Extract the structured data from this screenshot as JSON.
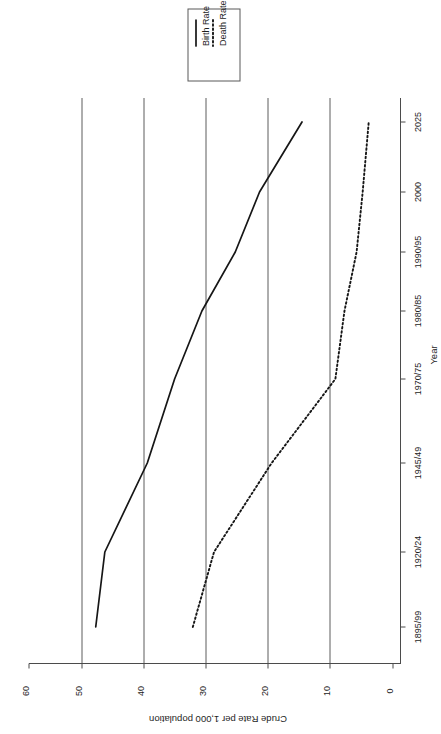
{
  "chart_data": {
    "type": "line",
    "title": "",
    "xlabel": "Year",
    "ylabel": "Crude Rate per 1,000 population",
    "orientation": "rotated-90-ccw",
    "grid": true,
    "legend_position": "top-left",
    "ylim": [
      0,
      60
    ],
    "yticks": [
      0,
      10,
      20,
      30,
      40,
      50,
      60
    ],
    "ytick_labels": [
      "0",
      "10",
      "20",
      "30",
      "40",
      "50",
      "60"
    ],
    "gridlines_at": [
      10,
      20,
      30,
      40,
      50
    ],
    "categories": [
      "1895/99",
      "1920/24",
      "1945/49",
      "1970/75",
      "1980/85",
      "1990/95",
      "2000",
      "2025"
    ],
    "x": [
      "1895/99",
      "1920/24",
      "1945/49",
      "1970/75",
      "1980/85",
      "1990/95",
      "2000",
      "2025"
    ],
    "series": [
      {
        "name": "Birth Rate",
        "style": "solid",
        "color": "#161616",
        "values": [
          49.0,
          47.5,
          40.5,
          36.0,
          31.5,
          26.0,
          22.0,
          15.0
        ]
      },
      {
        "name": "Death Rate",
        "style": "dotted",
        "color": "#161616",
        "values": [
          33.0,
          29.5,
          20.0,
          9.5,
          8.0,
          6.0,
          5.0,
          4.0
        ]
      }
    ]
  },
  "legend": {
    "items": [
      {
        "label": "Birth Rate",
        "style": "solid"
      },
      {
        "label": "Death Rate",
        "style": "dotted"
      }
    ]
  },
  "axes": {
    "x_title": "Year",
    "y_title": "Crude Rate per 1,000 population",
    "x_tick_labels": [
      "1895/99",
      "1920/24",
      "1945/49",
      "1970/75",
      "1980/85",
      "1990/95",
      "2000",
      "2025"
    ],
    "y_tick_labels": [
      "60",
      "50",
      "40",
      "30",
      "20",
      "10",
      "0"
    ]
  }
}
